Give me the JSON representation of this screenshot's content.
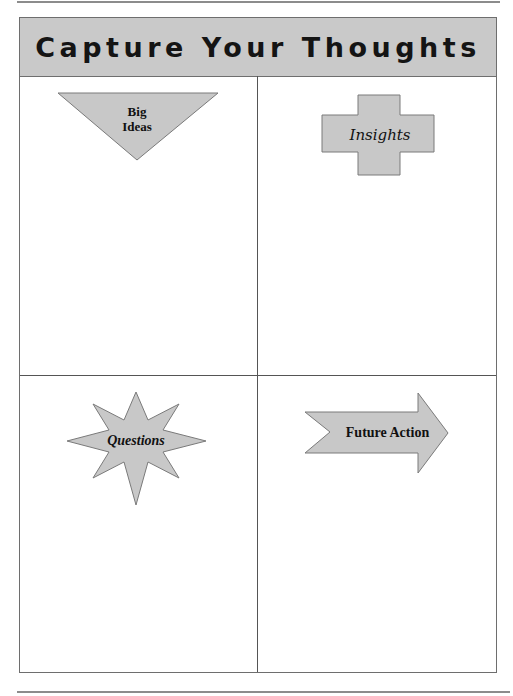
{
  "title": "Capture Your Thoughts",
  "quadrants": [
    {
      "label_line1": "Big",
      "label_line2": "Ideas",
      "shape": "inverted-triangle"
    },
    {
      "label": "Insights",
      "shape": "cross"
    },
    {
      "label": "Questions",
      "shape": "star"
    },
    {
      "label": "Future Action",
      "shape": "notched-right-arrow"
    }
  ],
  "colors": {
    "shape_fill": "#c8c8c8",
    "shape_stroke": "#7a7a7a",
    "header_fill": "#c9c9c9"
  }
}
